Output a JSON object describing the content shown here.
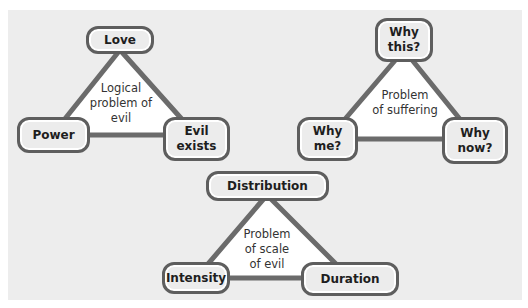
{
  "diagrams": [
    {
      "title": "Logical problem of evil",
      "center_lines": [
        "Logical",
        "problem of",
        "evil"
      ],
      "nodes": {
        "top": "Love",
        "left": "Power",
        "right_lines": [
          "Evil",
          "exists"
        ]
      }
    },
    {
      "title": "Problem of suffering",
      "center_lines": [
        "Problem",
        "of suffering"
      ],
      "nodes": {
        "top_lines": [
          "Why",
          "this?"
        ],
        "left_lines": [
          "Why",
          "me?"
        ],
        "right_lines": [
          "Why",
          "now?"
        ]
      }
    },
    {
      "title": "Problem of scale of evil",
      "center_lines": [
        "Problem",
        "of scale",
        "of evil"
      ],
      "nodes": {
        "top": "Distribution",
        "left": "Intensity",
        "right": "Duration"
      }
    }
  ],
  "colors": {
    "panel_bg": "#ededed",
    "node_fill": "#ececec",
    "node_border": "#5e5e5e",
    "triangle_stroke": "#6b6b6b",
    "triangle_fill": "#ffffff",
    "text": "#1e1e1e"
  }
}
